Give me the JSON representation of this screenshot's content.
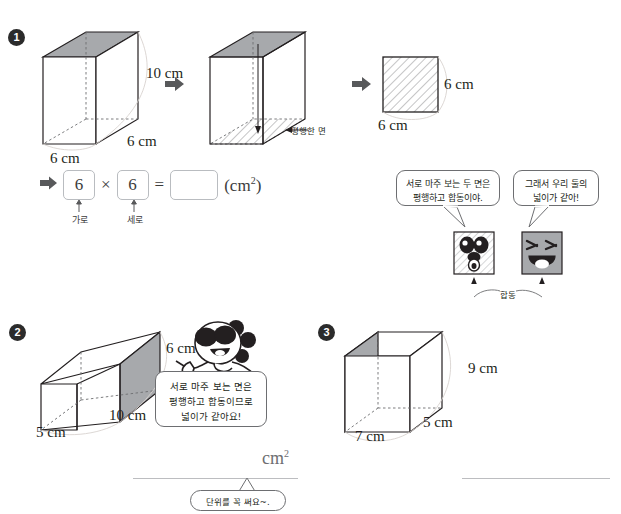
{
  "problem1": {
    "number": "1",
    "figure_a": {
      "label_height": "10 cm",
      "label_depth": "6 cm",
      "label_width": "6 cm"
    },
    "figure_b": {
      "annotation": "평행한 면"
    },
    "figure_c": {
      "label_right": "6 cm",
      "label_bottom": "6 cm"
    },
    "equation": {
      "factor1": "6",
      "factor2": "6",
      "operator": "×",
      "equals": "=",
      "answer": "",
      "unit": "cm",
      "unit_exp": "2",
      "label1": "가로",
      "label2": "세로"
    }
  },
  "callouts": {
    "bubble_left": "서로 마주 보는 두 면은\n평행하고 합동이야.",
    "bubble_left_line1": "서로 마주 보는 두 면은",
    "bubble_left_line2": "평행하고 합동이야.",
    "bubble_right_line1": "그래서 우리 둘의",
    "bubble_right_line2": "넓이가 같아!",
    "congruent_label": "합동"
  },
  "problem2": {
    "number": "2",
    "label_height": "6 cm",
    "label_depth": "10 cm",
    "label_width": "5 cm",
    "dog_bubble_line1": "서로 마주 보는 면은",
    "dog_bubble_line2": "평행하고 합동이므로",
    "dog_bubble_line3": "넓이가 같아요!"
  },
  "problem3": {
    "number": "3",
    "label_height": "9 cm",
    "label_depth": "5 cm",
    "label_width": "7 cm"
  },
  "answers": {
    "answer2_unit": "cm",
    "answer2_unit_exp": "2",
    "answer2_value": "",
    "answer3_value": "",
    "unit_hint": "단위를 꼭 써요~."
  },
  "colors": {
    "shade_gray": "#a7a9ac",
    "line_dark": "#231f20",
    "line_light": "#bcbdc0",
    "text": "#231f20"
  }
}
